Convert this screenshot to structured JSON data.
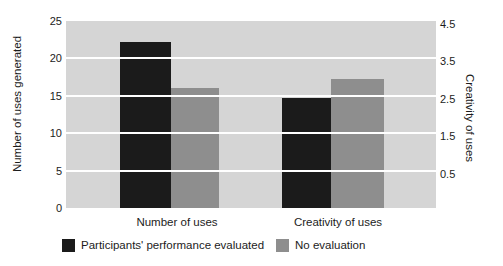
{
  "chart_data": {
    "type": "bar",
    "title": "",
    "categories": [
      "Number of uses",
      "Creativity of uses"
    ],
    "series": [
      {
        "name": "Participants' performance evaluated",
        "color": "#1b1b1b",
        "values": [
          22.2,
          2.45
        ]
      },
      {
        "name": "No evaluation",
        "color": "#8e8e8e",
        "values": [
          16.1,
          2.95
        ]
      }
    ],
    "value_axis_per_category": [
      "left",
      "right"
    ],
    "left_axis": {
      "label": "Number of uses generated",
      "min": 0,
      "max": 25,
      "ticks": [
        25,
        20,
        15,
        10,
        5,
        0
      ]
    },
    "right_axis": {
      "label": "Creativity of uses",
      "min": -0.5,
      "max": 4.5,
      "ticks": [
        4.5,
        3.5,
        2.5,
        1.5,
        0.5
      ]
    },
    "legend": {
      "position": "bottom",
      "items": [
        "Participants' performance evaluated",
        "No evaluation"
      ]
    },
    "grid": true,
    "plot_background": "#d5d5d5",
    "gridline_color": "#ffffff",
    "text_color": "#1c1c1c",
    "figure_background": "#ffffff"
  }
}
